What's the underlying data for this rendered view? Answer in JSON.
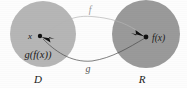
{
  "figure": {
    "type": "function-composition-diagram",
    "background_color": "#fdfdfd"
  },
  "sets": {
    "domain": {
      "label": "D",
      "element_label": "x",
      "composition_label": "g(f(x))",
      "fill_color": "#b6b6b6",
      "center_x": 43,
      "center_y": 34,
      "radius": 33
    },
    "range": {
      "label": "R",
      "element_label": "f(x)",
      "fill_color": "#9a9a9a",
      "center_x": 146,
      "center_y": 34,
      "radius": 34
    }
  },
  "maps": [
    {
      "name": "forward-map",
      "label": "f",
      "direction": "domain-to-range",
      "label_color": "#9a9a9a"
    },
    {
      "name": "inverse-map",
      "label": "g",
      "direction": "range-to-domain",
      "label_color": "#555555"
    }
  ],
  "points": [
    {
      "name": "x-point",
      "label": "x",
      "cx": 40,
      "cy": 36
    },
    {
      "name": "fx-point",
      "label": "f(x)",
      "cx": 146,
      "cy": 37
    }
  ]
}
